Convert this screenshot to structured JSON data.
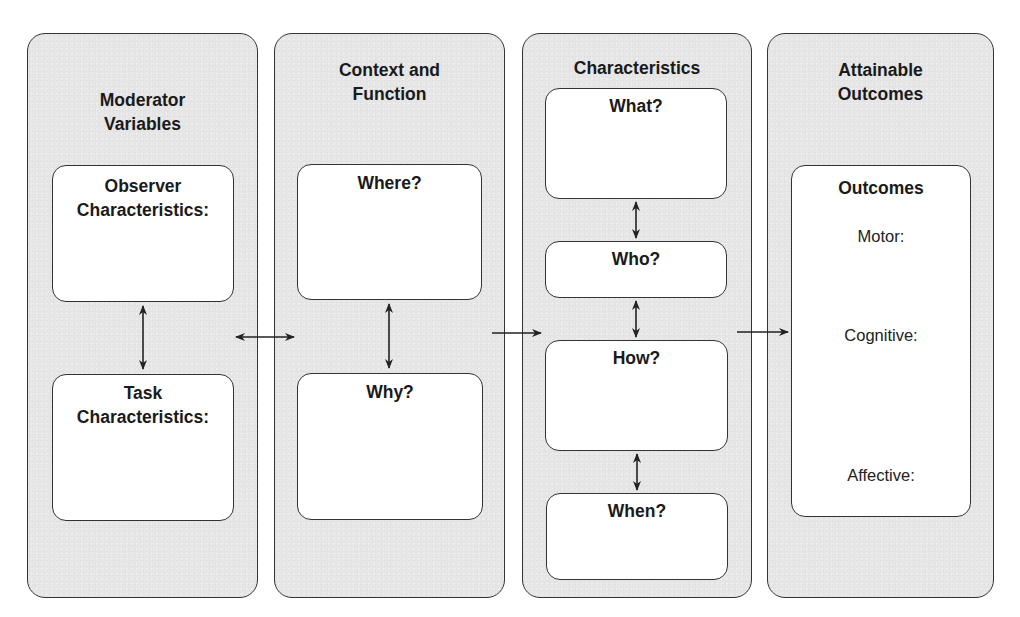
{
  "diagram": {
    "panels": [
      {
        "title": "Moderator\nVariables",
        "boxes": [
          {
            "title": "Observer\nCharacteristics:"
          },
          {
            "title": "Task\nCharacteristics:"
          }
        ]
      },
      {
        "title": "Context and\nFunction",
        "boxes": [
          {
            "title": "Where?"
          },
          {
            "title": "Why?"
          }
        ]
      },
      {
        "title": "Characteristics",
        "boxes": [
          {
            "title": "What?"
          },
          {
            "title": "Who?"
          },
          {
            "title": "How?"
          },
          {
            "title": "When?"
          }
        ]
      },
      {
        "title": "Attainable\nOutcomes",
        "boxes": [
          {
            "title": "Outcomes",
            "items": [
              "Motor:",
              "Cognitive:",
              "Affective:"
            ]
          }
        ]
      }
    ],
    "connections": [
      {
        "from": "Observer Characteristics",
        "to": "Task Characteristics",
        "type": "bidirectional-arrow"
      },
      {
        "from": "Moderator Variables",
        "to": "Context and Function",
        "type": "bidirectional-arrow"
      },
      {
        "from": "Where?",
        "to": "Why?",
        "type": "bidirectional-arrow"
      },
      {
        "from": "Context and Function",
        "to": "Characteristics",
        "type": "arrow"
      },
      {
        "from": "What?",
        "to": "Who?",
        "type": "bidirectional-arrow"
      },
      {
        "from": "Who?",
        "to": "How?",
        "type": "bidirectional-arrow"
      },
      {
        "from": "How?",
        "to": "When?",
        "type": "bidirectional-arrow"
      },
      {
        "from": "Characteristics",
        "to": "Attainable Outcomes",
        "type": "arrow"
      }
    ],
    "colors": {
      "panel_fill": "#e6e6e6",
      "box_fill": "#ffffff",
      "stroke": "#333333",
      "text": "#1a1a1a"
    }
  }
}
